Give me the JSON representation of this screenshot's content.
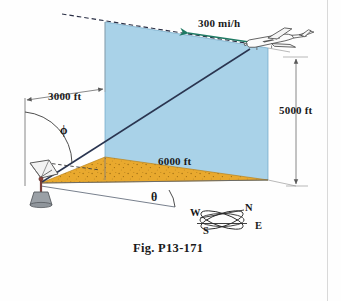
{
  "figure": {
    "caption": "Fig. P13-171",
    "domain_kind": "engineering-dynamics-diagram",
    "labels": {
      "velocity": "300 mi/h",
      "horizontal_offset": "3000 ft",
      "altitude": "5000 ft",
      "ground_range": "6000 ft",
      "angle_phi": "ϕ",
      "angle_theta": "θ"
    },
    "compass": {
      "north": "N",
      "south": "S",
      "east": "E",
      "west": "W"
    },
    "objects": {
      "aircraft": "airplane-icon",
      "tracker": "radar-dish-icon",
      "vertical_plane": "blue-vertical-plane",
      "ground_plane": "orange-ground-triangle",
      "sight_line": "line-of-sight",
      "flight_path": "dashed-flight-path"
    },
    "colors": {
      "plane_fill": "#a9d2e8",
      "plane_edge": "#5a8fb0",
      "ground_fill": "#e9a92e",
      "ground_speckle": "#9a6a10",
      "line": "#2a2f45",
      "velocity_arrow": "#1f7a63",
      "dim_line": "#6a6a6a",
      "text": "#1a1a1a",
      "page_edge": "#d9d9d9"
    }
  }
}
